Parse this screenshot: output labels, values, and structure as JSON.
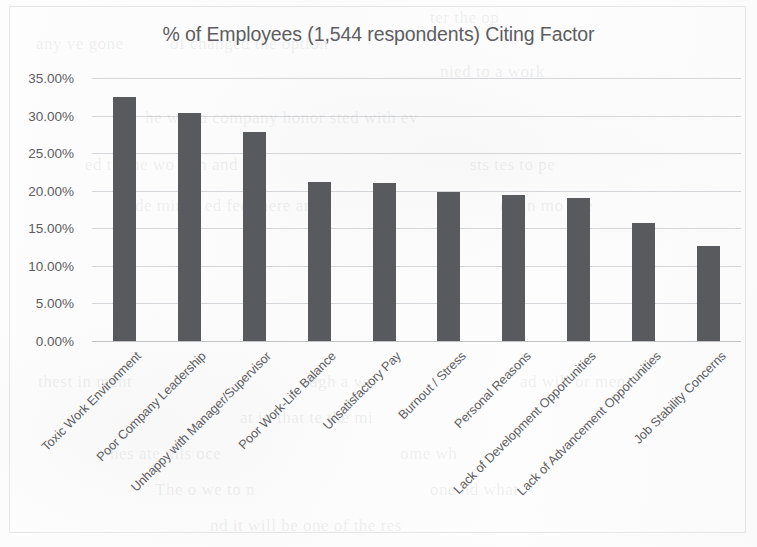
{
  "chart_data": {
    "type": "bar",
    "title": "% of Employees (1,544 respondents) Citing Factor",
    "xlabel": "",
    "ylabel": "",
    "ylim": [
      0,
      35
    ],
    "grid": true,
    "legend": null,
    "y_tick_labels": [
      "35.00%",
      "30.00%",
      "25.00%",
      "20.00%",
      "15.00%",
      "10.00%",
      "5.00%",
      "0.00%"
    ],
    "y_tick_values": [
      35,
      30,
      25,
      20,
      15,
      10,
      5,
      0
    ],
    "categories": [
      "Toxic Work Environment",
      "Poor Company Leadership",
      "Unhappy with Manager/Supervisor",
      "Poor Work-Life Balance",
      "Unsatisfactory Pay",
      "Burnout / Stress",
      "Personal Reasons",
      "Lack of Development Opportunities",
      "Lack of Advancement Opportunities",
      "Job Stability Concerns"
    ],
    "values": [
      32.5,
      30.4,
      27.8,
      21.2,
      21.0,
      19.8,
      19.4,
      19.0,
      15.7,
      12.6
    ],
    "bar_color": "#595a5d",
    "gridline_color": "#969aa0",
    "text_color": "#5d5d62",
    "background_color": "#fdfdfd"
  },
  "background_bleed": [
    {
      "text": "any ve gone",
      "x": 36,
      "y": 34,
      "size": 17,
      "rotate": 0
    },
    {
      "text": "ter the op",
      "x": 430,
      "y": 8,
      "size": 17,
      "rotate": 0
    },
    {
      "text": "of changed the option",
      "x": 170,
      "y": 34,
      "size": 17,
      "rotate": 0
    },
    {
      "text": "nied to a work",
      "x": 440,
      "y": 62,
      "size": 17,
      "rotate": 0
    },
    {
      "text": "he was a company honor sted with ev",
      "x": 145,
      "y": 108,
      "size": 17,
      "rotate": 0
    },
    {
      "text": "ed to the wo rem and",
      "x": 85,
      "y": 155,
      "size": 17,
      "rotate": 0
    },
    {
      "text": "sts tes to pe",
      "x": 470,
      "y": 155,
      "size": 17,
      "rotate": 0
    },
    {
      "text": "de mines ed fed there any",
      "x": 135,
      "y": 196,
      "size": 17,
      "rotate": 0
    },
    {
      "text": "ed in mo eve",
      "x": 500,
      "y": 196,
      "size": 17,
      "rotate": 0
    },
    {
      "text": "thest in ment",
      "x": 38,
      "y": 372,
      "size": 17,
      "rotate": 0
    },
    {
      "text": "ough a wr",
      "x": 300,
      "y": 372,
      "size": 17,
      "rotate": 0
    },
    {
      "text": "ad will or men",
      "x": 520,
      "y": 372,
      "size": 17,
      "rotate": 0
    },
    {
      "text": "at in that te the mi",
      "x": 240,
      "y": 408,
      "size": 17,
      "rotate": 0
    },
    {
      "text": "hes ate this oce",
      "x": 110,
      "y": 444,
      "size": 17,
      "rotate": 0
    },
    {
      "text": "ome wh",
      "x": 400,
      "y": 444,
      "size": 17,
      "rotate": 0
    },
    {
      "text": "The o we to n",
      "x": 155,
      "y": 480,
      "size": 17,
      "rotate": 0
    },
    {
      "text": "one nd what",
      "x": 430,
      "y": 480,
      "size": 17,
      "rotate": 0
    },
    {
      "text": "nd it will be one of the res",
      "x": 210,
      "y": 516,
      "size": 17,
      "rotate": 0
    }
  ]
}
